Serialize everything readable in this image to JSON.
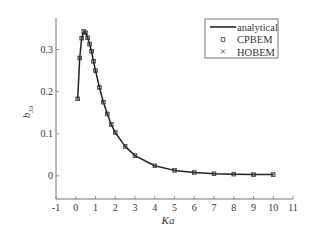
{
  "chart_data": {
    "type": "line",
    "title": "",
    "xlabel": "Ka",
    "ylabel": "b",
    "ylabel_subscript": "33",
    "xlim": [
      -1,
      11
    ],
    "ylim": [
      -0.055,
      0.375
    ],
    "xticks": [
      -1,
      0,
      1,
      2,
      3,
      4,
      5,
      6,
      7,
      8,
      9,
      10,
      11
    ],
    "yticks": [
      0,
      0.1,
      0.2,
      0.3
    ],
    "ytick_labels": [
      "0",
      "0.1",
      "0.2",
      "0.3"
    ],
    "grid": false,
    "legend_position": "top-right",
    "series": [
      {
        "name": "analytical",
        "style": "line",
        "color": "#222222",
        "x": [
          0.1,
          0.2,
          0.3,
          0.4,
          0.5,
          0.6,
          0.7,
          0.8,
          0.9,
          1.0,
          1.2,
          1.4,
          1.6,
          1.8,
          2.0,
          2.5,
          3.0,
          4.0,
          5.0,
          6.0,
          7.0,
          8.0,
          9.0,
          10.0
        ],
        "y": [
          0.183,
          0.28,
          0.327,
          0.343,
          0.34,
          0.328,
          0.313,
          0.296,
          0.272,
          0.25,
          0.21,
          0.175,
          0.147,
          0.122,
          0.103,
          0.07,
          0.048,
          0.024,
          0.013,
          0.008,
          0.005,
          0.004,
          0.003,
          0.003
        ]
      },
      {
        "name": "CPBEM",
        "style": "marker",
        "marker": "square",
        "color": "#333333",
        "x": [
          0.1,
          0.2,
          0.3,
          0.4,
          0.5,
          0.6,
          0.7,
          0.8,
          0.9,
          1.0,
          1.2,
          1.4,
          1.6,
          1.8,
          2.0,
          2.5,
          3.0,
          4.0,
          5.0,
          6.0,
          7.0,
          8.0,
          9.0,
          10.0
        ],
        "y": [
          0.183,
          0.28,
          0.327,
          0.343,
          0.34,
          0.328,
          0.313,
          0.296,
          0.272,
          0.25,
          0.21,
          0.175,
          0.147,
          0.122,
          0.103,
          0.07,
          0.048,
          0.024,
          0.013,
          0.008,
          0.005,
          0.004,
          0.003,
          0.003
        ]
      },
      {
        "name": "HOBEM",
        "style": "marker",
        "marker": "cross",
        "color": "#333333",
        "x": [
          0.1,
          0.2,
          0.3,
          0.4,
          0.5,
          0.6,
          0.7,
          0.8,
          0.9,
          1.0,
          1.2,
          1.4,
          1.6,
          1.8,
          2.0,
          2.5,
          3.0,
          4.0,
          5.0,
          6.0,
          7.0,
          8.0,
          9.0,
          10.0
        ],
        "y": [
          0.183,
          0.28,
          0.327,
          0.343,
          0.34,
          0.328,
          0.313,
          0.296,
          0.272,
          0.25,
          0.21,
          0.175,
          0.147,
          0.122,
          0.103,
          0.07,
          0.048,
          0.024,
          0.013,
          0.008,
          0.005,
          0.004,
          0.003,
          0.003
        ]
      }
    ]
  },
  "legend": {
    "items": [
      {
        "label": "analytical",
        "symbol": "line"
      },
      {
        "label": "CPBEM",
        "symbol": "square"
      },
      {
        "label": "HOBEM",
        "symbol": "cross"
      }
    ]
  }
}
